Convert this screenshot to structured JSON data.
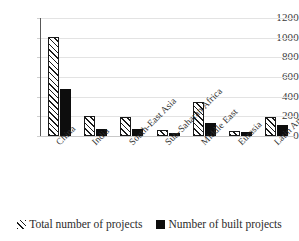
{
  "chart_data": {
    "type": "bar",
    "title": "",
    "subtitle": "",
    "xlabel": "",
    "ylabel": "",
    "ylim": [
      0,
      1200
    ],
    "yticks": [
      0,
      200,
      400,
      600,
      800,
      1000,
      1200
    ],
    "ytick_labels": [
      "0",
      "200",
      "400",
      "600",
      "800",
      "1000",
      "1200"
    ],
    "grid": true,
    "legend_position": "bottom",
    "categories": [
      "China",
      "India",
      "South-East Asia",
      "Sub-Saharan Africa",
      "Middle East",
      "Eurasia",
      "Latin America"
    ],
    "series": [
      {
        "name": "Total number of projects",
        "style": "hatched-diagonal",
        "color": "#1a1a1a",
        "values": [
          1010,
          200,
          190,
          60,
          345,
          55,
          195
        ]
      },
      {
        "name": "Number of built projects",
        "style": "solid",
        "color": "#0d0d0d",
        "values": [
          480,
          70,
          75,
          30,
          130,
          40,
          115
        ]
      }
    ]
  },
  "legend": {
    "items": [
      {
        "label": "Total number of projects",
        "swatch": "hatched-square-icon"
      },
      {
        "label": "Number of built projects",
        "swatch": "solid-square-icon"
      }
    ]
  }
}
